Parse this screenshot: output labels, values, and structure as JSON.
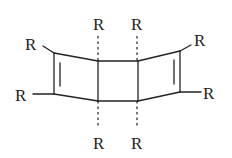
{
  "diagram": {
    "type": "chemical-structure",
    "colors": {
      "ink": "#222222",
      "background": "#ffffff"
    },
    "substituents": [
      {
        "id": "r-top-left",
        "label": "R"
      },
      {
        "id": "r-mid-left",
        "label": "R"
      },
      {
        "id": "r-center-top-left",
        "label": "R"
      },
      {
        "id": "r-center-top-right",
        "label": "R"
      },
      {
        "id": "r-center-bottom-left",
        "label": "R"
      },
      {
        "id": "r-center-bottom-right",
        "label": "R"
      },
      {
        "id": "r-top-right",
        "label": "R"
      },
      {
        "id": "r-mid-right",
        "label": "R"
      }
    ]
  }
}
